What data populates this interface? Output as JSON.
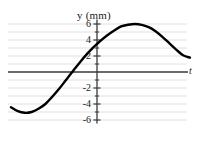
{
  "figure": {
    "background_color": "#ffffff",
    "curve_color": "#000000",
    "axis_color": "#3a3a3a",
    "grid_color": "#d8d8d8"
  },
  "labels": {
    "y_axis_title": "y (mm)",
    "t_axis_title": "t"
  },
  "chart_data": {
    "type": "line",
    "title": "",
    "subtitle": "",
    "xlabel": "t",
    "ylabel": "y (mm)",
    "xlim": [
      -1.25,
      1.35
    ],
    "ylim": [
      -6.6,
      6.6
    ],
    "grid": true,
    "grid_spacing_y": 1,
    "legend": "none",
    "x_ticks": [],
    "x_tick_labels": [],
    "y_ticks": [
      -6,
      -5,
      -4,
      -3,
      -2,
      -1,
      0,
      1,
      2,
      3,
      4,
      5,
      6
    ],
    "y_tick_labels": [
      "-6",
      "",
      "-4",
      "",
      "-2",
      "",
      "",
      "",
      "2",
      "",
      "4",
      "",
      "6"
    ],
    "y_major_ticks": [
      6,
      4,
      2,
      -2,
      -4,
      -6
    ],
    "y_major_tick_labels": [
      "6",
      "4",
      "2",
      "-2",
      "-4",
      "-6"
    ],
    "annotations": [],
    "series": [
      {
        "name": "y(t)",
        "description": "sinusoid, amplitude 6 mm, y-intercept about +2 mm, rising through zero just left of the y-axis, peak +6 mm, trough about -5 mm at left",
        "amplitude": 6,
        "units": "mm",
        "x": [
          -1.25,
          -1.15,
          -1.05,
          -0.95,
          -0.85,
          -0.75,
          -0.65,
          -0.55,
          -0.45,
          -0.35,
          -0.25,
          -0.15,
          -0.05,
          0.0,
          0.05,
          0.15,
          0.25,
          0.35,
          0.45,
          0.55,
          0.65,
          0.75,
          0.85,
          0.95,
          1.05,
          1.15,
          1.25,
          1.35
        ],
        "y": [
          -4.4,
          -4.9,
          -5.1,
          -5.0,
          -4.6,
          -4.0,
          -3.1,
          -2.1,
          -1.0,
          0.1,
          1.2,
          2.2,
          3.1,
          3.5,
          3.9,
          4.6,
          5.2,
          5.7,
          5.9,
          6.0,
          5.9,
          5.6,
          5.1,
          4.4,
          3.6,
          2.8,
          2.1,
          1.8
        ]
      }
    ]
  }
}
